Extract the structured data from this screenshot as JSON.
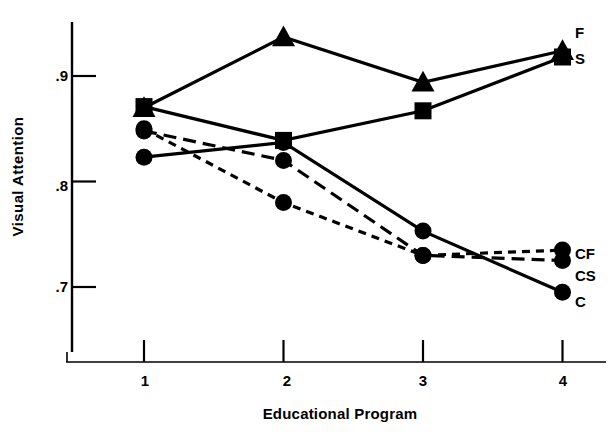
{
  "chart_data": {
    "type": "line",
    "title": "",
    "xlabel": "Educational Program",
    "ylabel": "Visual Attention",
    "x": [
      1,
      2,
      3,
      4
    ],
    "categories": [
      "1",
      "2",
      "3",
      "4"
    ],
    "xtick_labels": [
      "1",
      "2",
      "3",
      "4"
    ],
    "ytick_labels": [
      ".9",
      ".8",
      ".7"
    ],
    "ytick_values": [
      0.9,
      0.8,
      0.7
    ],
    "ylim": [
      0.655,
      0.955
    ],
    "xlim": [
      0.7,
      4.35
    ],
    "grid": false,
    "legend_position": "right-inline-labels",
    "series": [
      {
        "name": "F",
        "label": "F",
        "marker": "triangle",
        "line_style": "solid",
        "color": "#000000",
        "values": [
          0.87,
          0.937,
          0.894,
          0.924
        ]
      },
      {
        "name": "S",
        "label": "S",
        "marker": "square",
        "line_style": "solid",
        "color": "#000000",
        "values": [
          0.871,
          0.839,
          0.867,
          0.918
        ]
      },
      {
        "name": "CS",
        "label": "CS",
        "marker": "circle",
        "line_style": "long-dash",
        "color": "#000000",
        "values": [
          0.848,
          0.82,
          0.73,
          0.725
        ]
      },
      {
        "name": "CF",
        "label": "CF",
        "marker": "circle",
        "line_style": "short-dash",
        "color": "#000000",
        "values": [
          0.85,
          0.78,
          0.73,
          0.735
        ]
      },
      {
        "name": "C",
        "label": "C",
        "marker": "circle",
        "line_style": "solid",
        "color": "#000000",
        "values": [
          0.823,
          0.837,
          0.753,
          0.695
        ]
      }
    ]
  },
  "axis": {
    "y_label": "Visual Attention",
    "x_label": "Educational Program",
    "y_ticks": [
      {
        "text": ".9"
      },
      {
        "text": ".8"
      },
      {
        "text": ".7"
      }
    ],
    "x_ticks": [
      {
        "text": "1"
      },
      {
        "text": "2"
      },
      {
        "text": "3"
      },
      {
        "text": "4"
      }
    ]
  },
  "series_labels": {
    "f": "F",
    "s": "S",
    "cf": "CF",
    "cs": "CS",
    "c": "C"
  },
  "colors": {
    "ink": "#000000",
    "background": "#ffffff"
  }
}
